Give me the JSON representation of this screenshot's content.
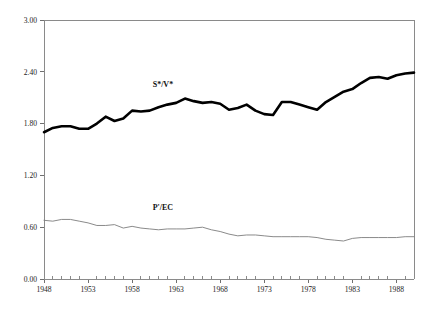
{
  "chart_data": {
    "type": "line",
    "title": "",
    "subtitle": "",
    "xlabel": "",
    "ylabel": "",
    "xlim": [
      1948,
      1990
    ],
    "ylim": [
      0.0,
      3.0
    ],
    "grid": false,
    "legend_position": "inline-annotation",
    "y_ticks": [
      "0.00",
      "0.60",
      "1.20",
      "1.80",
      "2.40",
      "3.00"
    ],
    "y_tick_values": [
      0.0,
      0.6,
      1.2,
      1.8,
      2.4,
      3.0
    ],
    "x_ticks": [
      "1948",
      "1953",
      "1958",
      "1963",
      "1968",
      "1973",
      "1978",
      "1983",
      "1988"
    ],
    "x_tick_values": [
      1948,
      1953,
      1958,
      1963,
      1968,
      1973,
      1978,
      1983,
      1988
    ],
    "x_minor_step": 1,
    "x": [
      1948,
      1949,
      1950,
      1951,
      1952,
      1953,
      1954,
      1955,
      1956,
      1957,
      1958,
      1959,
      1960,
      1961,
      1962,
      1963,
      1964,
      1965,
      1966,
      1967,
      1968,
      1969,
      1970,
      1971,
      1972,
      1973,
      1974,
      1975,
      1976,
      1977,
      1978,
      1979,
      1980,
      1981,
      1982,
      1983,
      1984,
      1985,
      1986,
      1987,
      1988,
      1989,
      1990
    ],
    "series": [
      {
        "name": "S*/V*",
        "label": "S*/V*",
        "color": "#000000",
        "style": "thick-solid",
        "label_x": 1961.5,
        "label_y": 2.22,
        "values": [
          1.7,
          1.75,
          1.77,
          1.77,
          1.74,
          1.74,
          1.8,
          1.88,
          1.83,
          1.86,
          1.95,
          1.94,
          1.95,
          1.99,
          2.02,
          2.04,
          2.09,
          2.06,
          2.04,
          2.05,
          2.03,
          1.96,
          1.98,
          2.02,
          1.95,
          1.91,
          1.9,
          2.05,
          2.05,
          2.02,
          1.99,
          1.96,
          2.05,
          2.11,
          2.17,
          2.2,
          2.27,
          2.33,
          2.34,
          2.32,
          2.36,
          2.38,
          2.39
        ]
      },
      {
        "name": "P'/EC",
        "label": "P'/EC",
        "color": "#7d7d7d",
        "style": "thin-solid",
        "label_x": 1961.5,
        "label_y": 0.8,
        "values": [
          0.68,
          0.67,
          0.69,
          0.69,
          0.67,
          0.65,
          0.62,
          0.62,
          0.63,
          0.59,
          0.61,
          0.59,
          0.58,
          0.57,
          0.58,
          0.58,
          0.58,
          0.59,
          0.6,
          0.57,
          0.55,
          0.52,
          0.5,
          0.51,
          0.51,
          0.5,
          0.49,
          0.49,
          0.49,
          0.49,
          0.49,
          0.48,
          0.46,
          0.45,
          0.44,
          0.47,
          0.48,
          0.48,
          0.48,
          0.48,
          0.48,
          0.49,
          0.49
        ]
      }
    ]
  }
}
